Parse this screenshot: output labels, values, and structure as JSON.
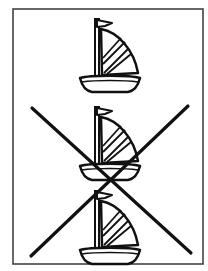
{
  "figure": {
    "description": "Three sailboats stacked vertically in a framed card; the bottom two sailboats are crossed out by a large X",
    "frame": {
      "x": 13,
      "y": 9,
      "width": 190,
      "height": 255,
      "stroke": "#444444"
    },
    "boats": [
      {
        "id": 1,
        "label": "sailboat",
        "crossed_out": false,
        "offset_y": 0
      },
      {
        "id": 2,
        "label": "sailboat",
        "crossed_out": true,
        "offset_y": 88
      },
      {
        "id": 3,
        "label": "sailboat",
        "crossed_out": true,
        "offset_y": 172
      }
    ],
    "cross_mark": {
      "label": "X",
      "line1": {
        "x1": 32,
        "y1": 108,
        "x2": 191,
        "y2": 253
      },
      "line2": {
        "x1": 188,
        "y1": 106,
        "x2": 31,
        "y2": 256
      },
      "color": "#111111"
    },
    "ink_color": "#111111",
    "background": "#ffffff"
  }
}
